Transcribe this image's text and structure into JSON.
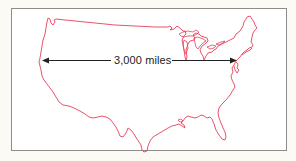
{
  "figure": {
    "map_region": "contiguous-united-states",
    "outline_color": "#e8405a",
    "frame_color": "#8c8c8c",
    "arrow_color": "#222222",
    "distance_label": "3,000 miles"
  }
}
